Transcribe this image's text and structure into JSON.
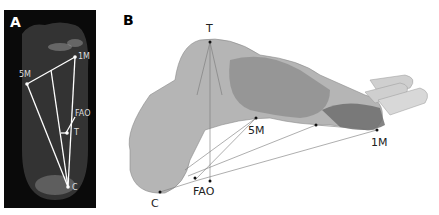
{
  "figure": {
    "panels": [
      {
        "letter": "A",
        "description": "Plantar radiographic view of foot with landmark lines",
        "landmarks": {
          "m1": "1M",
          "m5": "5M",
          "fao": "FAO",
          "t": "T",
          "c": "C"
        }
      },
      {
        "letter": "B",
        "description": "3D bone rendering of foot with landmark lines",
        "landmarks": {
          "t": "T",
          "m5": "5M",
          "m1": "1M",
          "fao": "FAO",
          "c": "C"
        }
      }
    ]
  }
}
